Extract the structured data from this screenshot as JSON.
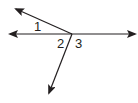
{
  "diagram": {
    "type": "angle-figure",
    "vertex": {
      "x": 72,
      "y": 34
    },
    "rays": [
      {
        "name": "left-ray",
        "tip": {
          "x": 10,
          "y": 34
        }
      },
      {
        "name": "right-ray",
        "tip": {
          "x": 135,
          "y": 34
        }
      },
      {
        "name": "upper-left-ray",
        "tip": {
          "x": 16,
          "y": 9
        }
      },
      {
        "name": "lower-ray",
        "tip": {
          "x": 49,
          "y": 93
        }
      }
    ],
    "labels": [
      {
        "text": "1",
        "x": 34,
        "y": 31
      },
      {
        "text": "2",
        "x": 57,
        "y": 48
      },
      {
        "text": "3",
        "x": 75,
        "y": 48
      }
    ],
    "colors": {
      "line": "#231f20",
      "background": "#ffffff"
    }
  }
}
